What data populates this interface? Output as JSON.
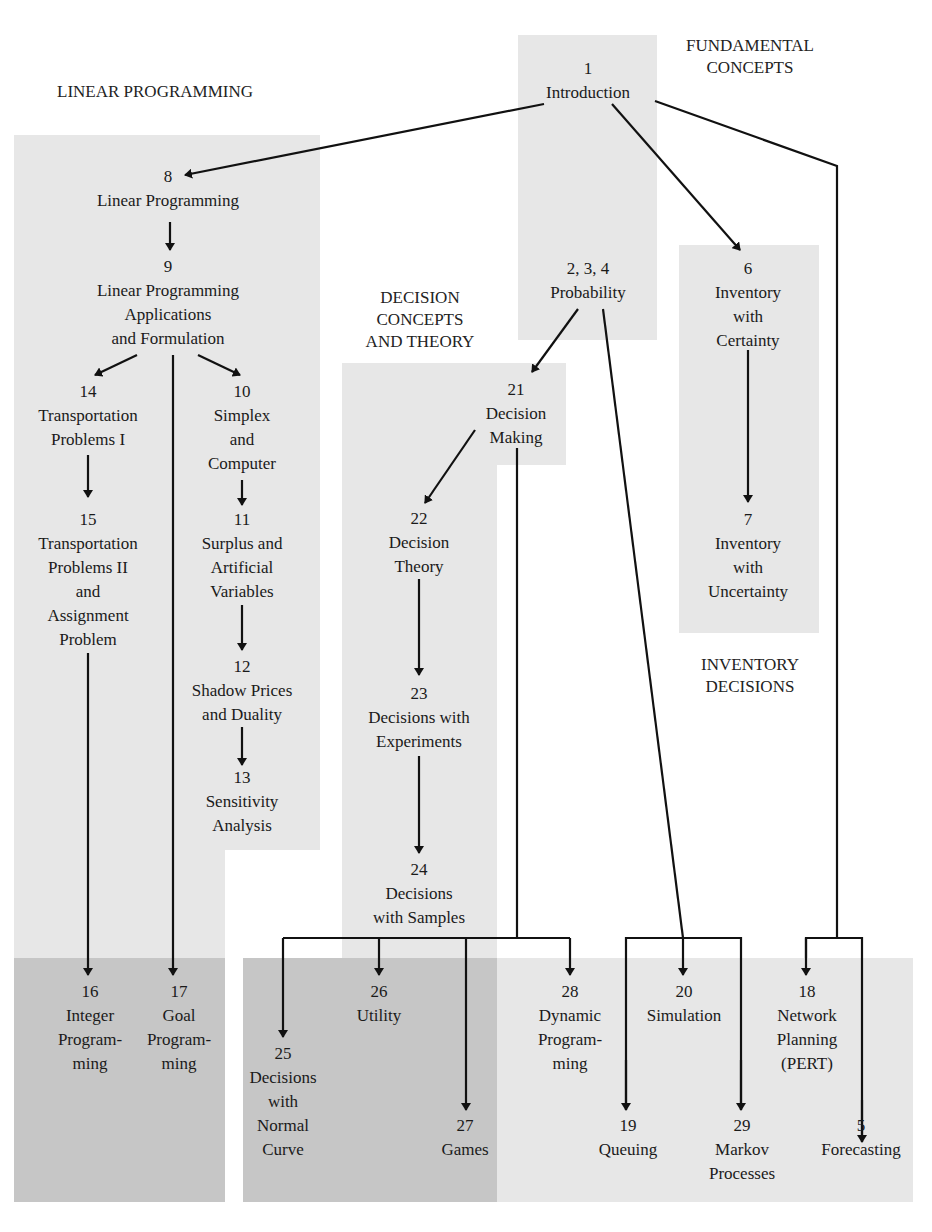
{
  "sections": {
    "fundamental": "FUNDAMENTAL\nCONCEPTS",
    "linear": "LINEAR PROGRAMMING",
    "decision": "DECISION\nCONCEPTS\nAND THEORY",
    "inventory": "INVENTORY\nDECISIONS"
  },
  "nodes": {
    "n1": {
      "num": "1",
      "label": "Introduction"
    },
    "n8": {
      "num": "8",
      "label": "Linear Programming"
    },
    "n9": {
      "num": "9",
      "label": "Linear Programming\nApplications\nand Formulation"
    },
    "n14": {
      "num": "14",
      "label": "Transportation\nProblems I"
    },
    "n15": {
      "num": "15",
      "label": "Transportation\nProblems II\nand\nAssignment\nProblem"
    },
    "n10": {
      "num": "10",
      "label": "Simplex\nand\nComputer"
    },
    "n11": {
      "num": "11",
      "label": "Surplus and\nArtificial\nVariables"
    },
    "n12": {
      "num": "12",
      "label": "Shadow Prices\nand Duality"
    },
    "n13": {
      "num": "13",
      "label": "Sensitivity\nAnalysis"
    },
    "n234": {
      "num": "2, 3, 4",
      "label": "Probability"
    },
    "n6": {
      "num": "6",
      "label": "Inventory\nwith\nCertainty"
    },
    "n7": {
      "num": "7",
      "label": "Inventory\nwith\nUncertainty"
    },
    "n21": {
      "num": "21",
      "label": "Decision\nMaking"
    },
    "n22": {
      "num": "22",
      "label": "Decision\nTheory"
    },
    "n23": {
      "num": "23",
      "label": "Decisions with\nExperiments"
    },
    "n24": {
      "num": "24",
      "label": "Decisions\nwith Samples"
    },
    "n16": {
      "num": "16",
      "label": "Integer\nProgram-\nming"
    },
    "n17": {
      "num": "17",
      "label": "Goal\nProgram-\nming"
    },
    "n25": {
      "num": "25",
      "label": "Decisions\nwith\nNormal\nCurve"
    },
    "n26": {
      "num": "26",
      "label": "Utility"
    },
    "n27": {
      "num": "27",
      "label": "Games"
    },
    "n28": {
      "num": "28",
      "label": "Dynamic\nProgram-\nming"
    },
    "n20": {
      "num": "20",
      "label": "Simulation"
    },
    "n19": {
      "num": "19",
      "label": "Queuing"
    },
    "n29": {
      "num": "29",
      "label": "Markov\nProcesses"
    },
    "n18": {
      "num": "18",
      "label": "Network\nPlanning\n(PERT)"
    },
    "n5": {
      "num": "5",
      "label": "Forecasting"
    }
  },
  "colors": {
    "light_panel": "#e7e7e7",
    "dark_panel": "#c6c6c6",
    "line": "#111111"
  }
}
